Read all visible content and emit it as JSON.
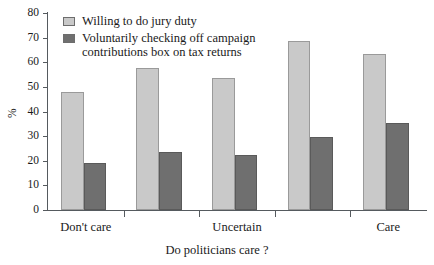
{
  "chart_data": {
    "type": "bar",
    "title": "",
    "xlabel": "Do politicians care ?",
    "ylabel": "%",
    "ylim": [
      0,
      80
    ],
    "yticks": [
      0,
      10,
      20,
      30,
      40,
      50,
      60,
      70,
      80
    ],
    "grid": false,
    "legend_position": "top-left",
    "categories": [
      "Don't care",
      "",
      "Uncertain",
      "",
      "Care"
    ],
    "category_labels_visible": [
      "Don't care",
      "Uncertain",
      "Care"
    ],
    "series": [
      {
        "name": "Willing to do jury duty",
        "color": "#c9c9c9",
        "values": [
          48,
          57.5,
          53.5,
          68.5,
          63.5
        ]
      },
      {
        "name": "Voluntarily checking off campaign\ncontributions box on tax returns",
        "color": "#6f6f6f",
        "values": [
          19,
          23.5,
          22.5,
          29.5,
          35.5
        ]
      }
    ]
  }
}
